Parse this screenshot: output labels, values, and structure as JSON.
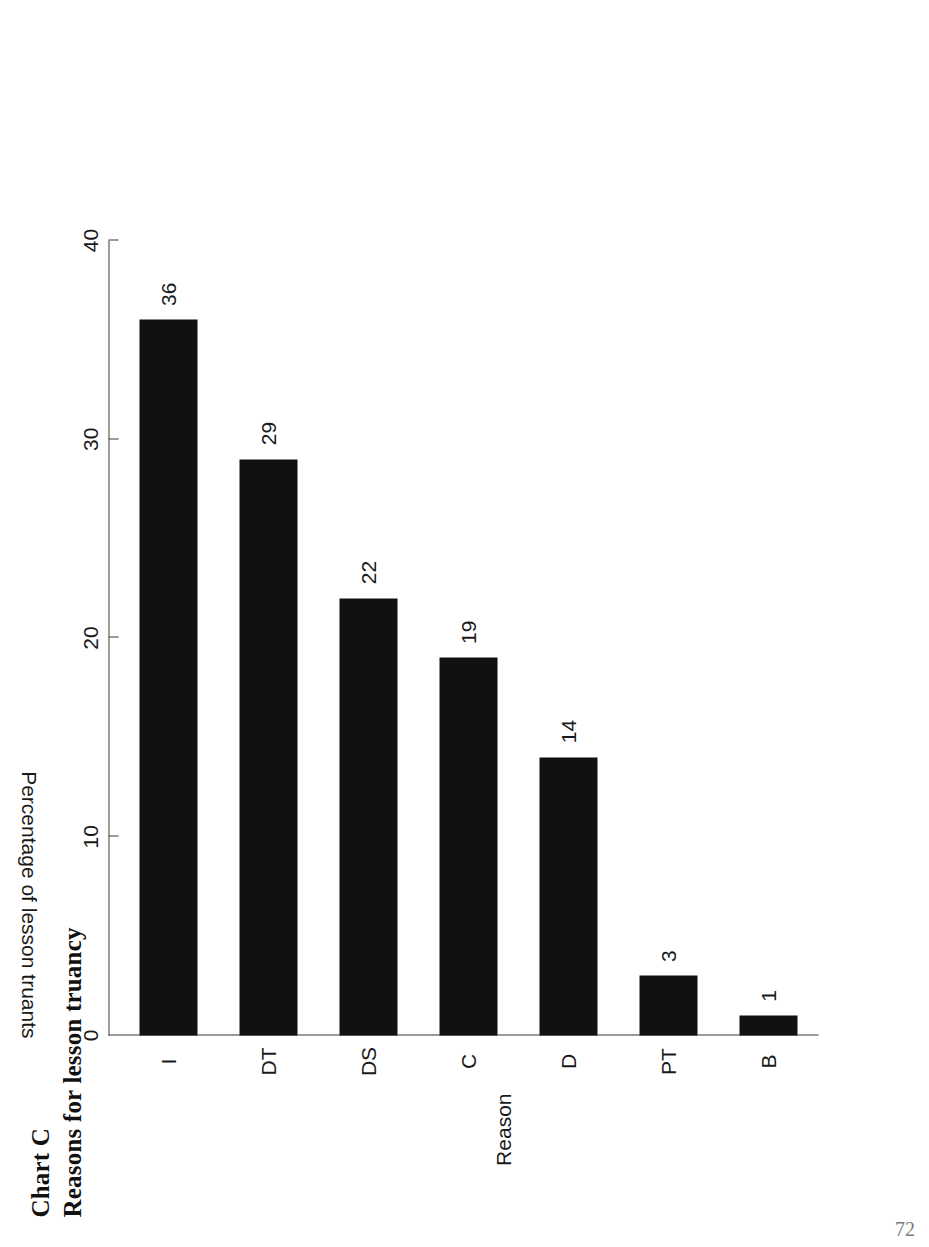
{
  "document": {
    "page_number": "72"
  },
  "chart_header": {
    "label": "Chart C",
    "caption": "Reasons for lesson truancy"
  },
  "chart_data": {
    "type": "bar",
    "title": "Reasons for lesson truancy",
    "subtitle": "Chart C",
    "orientation": "vertical",
    "categories": [
      "I",
      "DT",
      "DS",
      "C",
      "D",
      "PT",
      "B"
    ],
    "values": [
      36,
      29,
      22,
      19,
      14,
      3,
      1
    ],
    "value_labels": [
      "36",
      "29",
      "22",
      "19",
      "14",
      "3",
      "1"
    ],
    "xlabel": "Reason",
    "ylabel": "Percentage of lesson truants",
    "ylim": [
      0,
      40
    ],
    "yticks": [
      0,
      10,
      20,
      30,
      40
    ],
    "ytick_labels": [
      "0",
      "10",
      "20",
      "30",
      "40"
    ],
    "grid": false,
    "legend": false,
    "bar_color": "#111111",
    "axis_color": "#3a3a3a",
    "rotation_on_page_degrees": -90
  }
}
